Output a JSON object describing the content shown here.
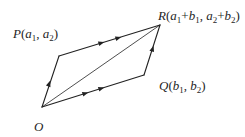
{
  "diagram": {
    "colors": {
      "stroke": "#222222",
      "text": "#1f1f1f",
      "background": "#ffffff"
    },
    "points": {
      "O": {
        "label": "O",
        "x": 42,
        "y": 107
      },
      "P": {
        "label": "P(a1, a2)",
        "x": 59,
        "y": 56
      },
      "Q": {
        "label": "Q(b1, b2)",
        "x": 144,
        "y": 75
      },
      "R": {
        "label": "R(a1+b1, a2+b2)",
        "x": 160,
        "y": 25
      }
    },
    "edges": [
      {
        "from": "O",
        "to": "P",
        "arrows": 1
      },
      {
        "from": "P",
        "to": "R",
        "arrows": 2
      },
      {
        "from": "O",
        "to": "Q",
        "arrows": 2
      },
      {
        "from": "Q",
        "to": "R",
        "arrows": 1
      },
      {
        "from": "O",
        "to": "R",
        "arrows": 0,
        "role": "diagonal"
      }
    ],
    "labels": {
      "O": {
        "name": "O"
      },
      "P": {
        "name": "P",
        "open": "(",
        "a1_base": "a",
        "a1_sub": "1",
        "sep": ", ",
        "a2_base": "a",
        "a2_sub": "2",
        "close": ")"
      },
      "Q": {
        "name": "Q",
        "open": "(",
        "b1_base": "b",
        "b1_sub": "1",
        "sep": ", ",
        "b2_base": "b",
        "b2_sub": "2",
        "close": ")"
      },
      "R": {
        "name": "R",
        "open": "(",
        "a1_base": "a",
        "a1_sub": "1",
        "plus1": "+",
        "b1_base": "b",
        "b1_sub": "1",
        "sep": ", ",
        "a2_base": "a",
        "a2_sub": "2",
        "plus2": "+",
        "b2_base": "b",
        "b2_sub": "2",
        "close": ")"
      }
    }
  }
}
